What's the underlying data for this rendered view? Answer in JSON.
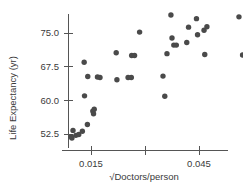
{
  "chart_data": {
    "type": "scatter",
    "title": "",
    "xlabel": "√Doctors/person",
    "ylabel": "Life Expectancy (yr)",
    "xticks": [
      0.015,
      0.03,
      0.045,
      0.06
    ],
    "xtick_labels": [
      "0.015",
      "",
      "0.045",
      ""
    ],
    "yticks": [
      52.5,
      60.0,
      67.5,
      75.0
    ],
    "ytick_labels": [
      "52.5",
      "60.0",
      "67.5",
      "75.0"
    ],
    "xlim": [
      0.0055,
      0.0695
    ],
    "ylim": [
      50.1,
      79.8
    ],
    "grid": false,
    "legend": null,
    "marker": "filled-circle",
    "marker_color": "#4a4a4a",
    "points": [
      {
        "x": 0.0095,
        "y": 51.9
      },
      {
        "x": 0.0097,
        "y": 51.6
      },
      {
        "x": 0.01,
        "y": 53.3
      },
      {
        "x": 0.0108,
        "y": 52.2
      },
      {
        "x": 0.0116,
        "y": 52.4
      },
      {
        "x": 0.0126,
        "y": 53.1
      },
      {
        "x": 0.014,
        "y": 54.6
      },
      {
        "x": 0.0132,
        "y": 61.0
      },
      {
        "x": 0.0155,
        "y": 57.6
      },
      {
        "x": 0.0157,
        "y": 57.0
      },
      {
        "x": 0.0159,
        "y": 58.0
      },
      {
        "x": 0.0141,
        "y": 65.3
      },
      {
        "x": 0.0131,
        "y": 68.5
      },
      {
        "x": 0.0168,
        "y": 65.2
      },
      {
        "x": 0.0175,
        "y": 65.1
      },
      {
        "x": 0.0222,
        "y": 64.6
      },
      {
        "x": 0.0253,
        "y": 65.1
      },
      {
        "x": 0.0262,
        "y": 65.1
      },
      {
        "x": 0.022,
        "y": 70.6
      },
      {
        "x": 0.0263,
        "y": 70.0
      },
      {
        "x": 0.0271,
        "y": 70.0
      },
      {
        "x": 0.0285,
        "y": 75.2
      },
      {
        "x": 0.0355,
        "y": 60.9
      },
      {
        "x": 0.035,
        "y": 65.4
      },
      {
        "x": 0.0361,
        "y": 70.4
      },
      {
        "x": 0.0372,
        "y": 79.0
      },
      {
        "x": 0.0375,
        "y": 73.9
      },
      {
        "x": 0.038,
        "y": 72.3
      },
      {
        "x": 0.0387,
        "y": 72.3
      },
      {
        "x": 0.0416,
        "y": 72.9
      },
      {
        "x": 0.0421,
        "y": 76.3
      },
      {
        "x": 0.0443,
        "y": 78.2
      },
      {
        "x": 0.0446,
        "y": 74.6
      },
      {
        "x": 0.0464,
        "y": 75.6
      },
      {
        "x": 0.0466,
        "y": 70.2
      },
      {
        "x": 0.0472,
        "y": 76.4
      },
      {
        "x": 0.0561,
        "y": 78.6
      },
      {
        "x": 0.0593,
        "y": 78.6
      },
      {
        "x": 0.0571,
        "y": 70.1
      },
      {
        "x": 0.06,
        "y": 70.9
      }
    ]
  }
}
